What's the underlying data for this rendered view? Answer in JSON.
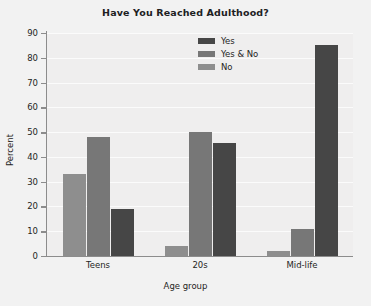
{
  "chart_data": {
    "type": "bar",
    "title": "Have You Reached Adulthood?",
    "xlabel": "Age group",
    "ylabel": "Percent",
    "categories": [
      "Teens",
      "20s",
      "Mid-life"
    ],
    "ylim": [
      0,
      90
    ],
    "yticks": [
      0,
      10,
      20,
      30,
      40,
      50,
      60,
      70,
      80,
      90
    ],
    "grid": true,
    "legend_position": "top-center",
    "series": [
      {
        "name": "No",
        "color": "#8e8e8e",
        "values": [
          33,
          4,
          2
        ]
      },
      {
        "name": "Yes & No",
        "color": "#777777",
        "values": [
          48,
          50,
          11
        ]
      },
      {
        "name": "Yes",
        "color": "#464646",
        "values": [
          19,
          45.5,
          85
        ]
      }
    ],
    "series_draw_order": [
      "No",
      "Yes & No",
      "Yes"
    ],
    "legend_order": [
      "Yes",
      "Yes & No",
      "No"
    ]
  },
  "colors": {
    "background": "#f2f2f2",
    "plot_background": "#efeeee",
    "gridline": "#fbfbfb",
    "axis": "#8c8c8c",
    "text": "#252523",
    "title_text": "#20201f"
  }
}
